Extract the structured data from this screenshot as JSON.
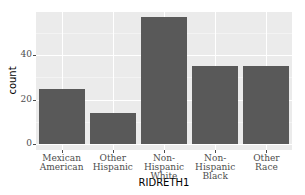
{
  "chart_data": {
    "type": "bar",
    "title": "",
    "xlabel": "RIDRETH1",
    "ylabel": "count",
    "categories": [
      "Mexican American",
      "Other Hispanic",
      "Non-Hispanic White",
      "Non-Hispanic Black",
      "Other Race"
    ],
    "category_lines": [
      [
        "Mexican",
        "American"
      ],
      [
        "Other",
        "Hispanic"
      ],
      [
        "Non-Hispanic",
        "White"
      ],
      [
        "Non-Hispanic",
        "Black"
      ],
      [
        "Other",
        "Race"
      ]
    ],
    "values": [
      25,
      14,
      57,
      35,
      35
    ],
    "yticks": [
      0,
      20,
      40
    ],
    "ylim": [
      0,
      60
    ],
    "grid": true,
    "legend": "none",
    "colors": {
      "bar": "#595959",
      "panel": "#ebebeb",
      "grid": "#ffffff"
    }
  },
  "axis": {
    "ytick_labels": [
      "0",
      "20",
      "40"
    ]
  }
}
